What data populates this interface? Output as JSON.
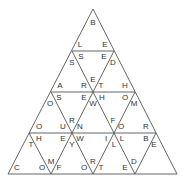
{
  "puzzle": {
    "type": "triangle-tile-puzzle",
    "rows": 4,
    "line_color": "#555555",
    "letters": [
      {
        "ch": "B",
        "x": 93,
        "y": 23
      },
      {
        "ch": "L",
        "x": 80,
        "y": 45
      },
      {
        "ch": "E",
        "x": 105,
        "y": 45
      },
      {
        "ch": "S",
        "x": 81,
        "y": 57
      },
      {
        "ch": "E",
        "x": 104,
        "y": 57
      },
      {
        "ch": "S",
        "x": 72,
        "y": 63
      },
      {
        "ch": "D",
        "x": 113,
        "y": 63
      },
      {
        "ch": "E",
        "x": 93,
        "y": 80
      },
      {
        "ch": "A",
        "x": 60,
        "y": 86
      },
      {
        "ch": "R",
        "x": 84,
        "y": 86
      },
      {
        "ch": "T",
        "x": 101,
        "y": 86
      },
      {
        "ch": "H",
        "x": 125,
        "y": 86
      },
      {
        "ch": "S",
        "x": 59,
        "y": 98
      },
      {
        "ch": "E",
        "x": 84,
        "y": 98
      },
      {
        "ch": "H",
        "x": 102,
        "y": 98
      },
      {
        "ch": "O",
        "x": 125,
        "y": 98
      },
      {
        "ch": "O",
        "x": 50,
        "y": 104
      },
      {
        "ch": "W",
        "x": 93,
        "y": 104
      },
      {
        "ch": "M",
        "x": 134,
        "y": 104
      },
      {
        "ch": "R",
        "x": 72,
        "y": 121
      },
      {
        "ch": "F",
        "x": 113,
        "y": 121
      },
      {
        "ch": "O",
        "x": 39,
        "y": 127
      },
      {
        "ch": "U",
        "x": 63,
        "y": 127
      },
      {
        "ch": "N",
        "x": 80,
        "y": 127
      },
      {
        "ch": "O",
        "x": 121,
        "y": 127
      },
      {
        "ch": "R",
        "x": 146,
        "y": 127
      },
      {
        "ch": "H",
        "x": 39,
        "y": 139
      },
      {
        "ch": "E",
        "x": 63,
        "y": 139
      },
      {
        "ch": "W",
        "x": 80,
        "y": 139
      },
      {
        "ch": "I",
        "x": 106,
        "y": 139
      },
      {
        "ch": "L",
        "x": 122,
        "y": 139
      },
      {
        "ch": "B",
        "x": 146,
        "y": 139
      },
      {
        "ch": "T",
        "x": 31,
        "y": 145
      },
      {
        "ch": "Y",
        "x": 72,
        "y": 145
      },
      {
        "ch": "L",
        "x": 114,
        "y": 145
      },
      {
        "ch": "E",
        "x": 154,
        "y": 145
      },
      {
        "ch": "M",
        "x": 51,
        "y": 162
      },
      {
        "ch": "R",
        "x": 93,
        "y": 162
      },
      {
        "ch": "D",
        "x": 134,
        "y": 162
      },
      {
        "ch": "C",
        "x": 17,
        "y": 168
      },
      {
        "ch": "O",
        "x": 42,
        "y": 168
      },
      {
        "ch": "F",
        "x": 59,
        "y": 168
      },
      {
        "ch": "O",
        "x": 84,
        "y": 168
      },
      {
        "ch": "T",
        "x": 101,
        "y": 168
      },
      {
        "ch": "E",
        "x": 125,
        "y": 168
      }
    ]
  }
}
